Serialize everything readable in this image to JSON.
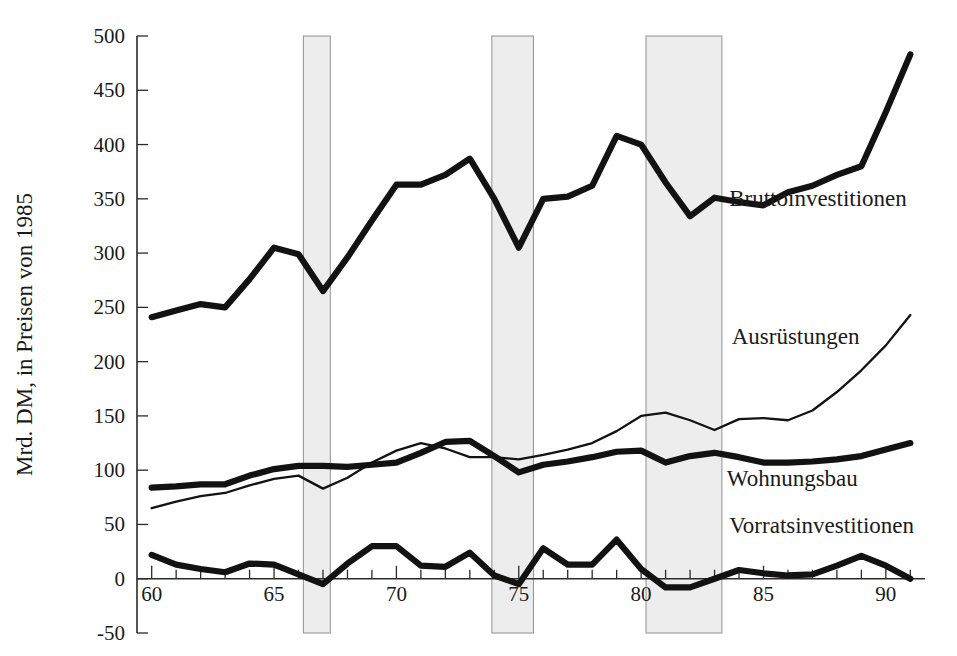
{
  "chart_data": {
    "type": "line",
    "title": "",
    "subtitle": "",
    "xlabel": "",
    "ylabel": "Mrd. DM, in Preisen von 1985",
    "xlim": [
      59.4,
      91.6
    ],
    "ylim": [
      -50,
      500
    ],
    "yticks": [
      -50,
      0,
      50,
      100,
      150,
      200,
      250,
      300,
      350,
      400,
      450,
      500
    ],
    "ytick_labels": [
      "-50",
      "0",
      "50",
      "100",
      "150",
      "200",
      "250",
      "300",
      "350",
      "400",
      "450",
      "500"
    ],
    "xticks": [
      60,
      61,
      62,
      63,
      64,
      65,
      66,
      67,
      68,
      69,
      70,
      71,
      72,
      73,
      74,
      75,
      76,
      77,
      78,
      79,
      80,
      81,
      82,
      83,
      84,
      85,
      86,
      87,
      88,
      89,
      90,
      91
    ],
    "xtick_labels_shown": [
      "60",
      "65",
      "70",
      "75",
      "80",
      "85",
      "90"
    ],
    "xtick_label_values": [
      60,
      65,
      70,
      75,
      80,
      85,
      90
    ],
    "grid": false,
    "legend_position": "inline-right",
    "x": [
      60,
      61,
      62,
      63,
      64,
      65,
      66,
      67,
      68,
      69,
      70,
      71,
      72,
      73,
      74,
      75,
      76,
      77,
      78,
      79,
      80,
      81,
      82,
      83,
      84,
      85,
      86,
      87,
      88,
      89,
      90,
      91
    ],
    "series": [
      {
        "name": "Bruttoinvestitionen",
        "style": "thick",
        "label_x": 83.6,
        "label_y": 343,
        "values": [
          241,
          247,
          253,
          250,
          276,
          305,
          299,
          265,
          296,
          330,
          363,
          363,
          372,
          387,
          350,
          305,
          350,
          352,
          362,
          408,
          400,
          365,
          334,
          351,
          347,
          344,
          356,
          362,
          372,
          380,
          430,
          483
        ]
      },
      {
        "name": "Ausrüstungen",
        "style": "thin",
        "label_x": 83.7,
        "label_y": 216,
        "values": [
          65,
          71,
          76,
          79,
          86,
          92,
          95,
          83,
          93,
          107,
          118,
          125,
          120,
          112,
          112,
          110,
          114,
          119,
          125,
          136,
          150,
          153,
          146,
          137,
          147,
          148,
          146,
          155,
          172,
          192,
          215,
          243
        ]
      },
      {
        "name": "Wohnungsbau",
        "style": "thick",
        "label_x": 83.5,
        "label_y": 85,
        "values": [
          84,
          85,
          87,
          87,
          95,
          101,
          104,
          104,
          103,
          105,
          107,
          116,
          126,
          127,
          113,
          98,
          105,
          108,
          112,
          117,
          118,
          107,
          113,
          116,
          112,
          107,
          107,
          108,
          110,
          113,
          119,
          125
        ]
      },
      {
        "name": "Vorratsinvestitionen",
        "style": "thick",
        "label_x": 83.6,
        "label_y": 42,
        "values": [
          22,
          13,
          9,
          6,
          14,
          13,
          4,
          -5,
          14,
          30,
          30,
          12,
          11,
          24,
          3,
          -5,
          28,
          13,
          13,
          36,
          9,
          -8,
          -8,
          0,
          8,
          5,
          3,
          4,
          12,
          21,
          12,
          0
        ]
      }
    ],
    "shaded_bands": [
      {
        "name": "recession-1966-67",
        "start": 66.2,
        "end": 67.3
      },
      {
        "name": "recession-1974-75",
        "start": 73.9,
        "end": 75.6
      },
      {
        "name": "recession-1980-83",
        "start": 80.2,
        "end": 83.3
      }
    ],
    "band_color": "#ededed",
    "band_border_color": "#9a9a9a",
    "line_color": "#121212"
  }
}
